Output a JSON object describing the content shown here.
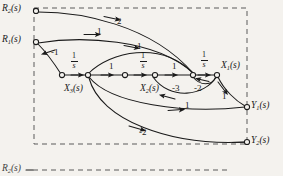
{
  "figure": {
    "kind": "signal-flow-graph",
    "background_color": "#f4f2ee",
    "ink_color": "#1a1a1a",
    "boundary": {
      "style": "dashed",
      "x": 34,
      "y": 8,
      "width": 213,
      "height": 136
    }
  },
  "nodes": [
    {
      "id": "R2",
      "label": "R",
      "sub": "2",
      "suffix": "(s)",
      "x": 36,
      "y": 11,
      "label_x": 2,
      "label_y": 4,
      "kind": "input",
      "open": true
    },
    {
      "id": "R1",
      "label": "R",
      "sub": "1",
      "suffix": "(s)",
      "x": 36,
      "y": 42,
      "label_x": 2,
      "label_y": 35,
      "kind": "input",
      "open": true
    },
    {
      "id": "n1",
      "label": "",
      "sub": "",
      "suffix": "",
      "x": 62,
      "y": 75,
      "label_x": 0,
      "label_y": 0,
      "kind": "sum",
      "open": true
    },
    {
      "id": "X3",
      "label": "X",
      "sub": "3",
      "suffix": "(s)",
      "x": 88,
      "y": 75,
      "label_x": 64,
      "label_y": 84,
      "kind": "state",
      "open": true
    },
    {
      "id": "n2",
      "label": "",
      "sub": "",
      "suffix": "",
      "x": 125,
      "y": 75,
      "label_x": 0,
      "label_y": 0,
      "kind": "sum",
      "open": true
    },
    {
      "id": "X2",
      "label": "X",
      "sub": "2",
      "suffix": "(s)",
      "x": 155,
      "y": 75,
      "label_x": 140,
      "label_y": 84,
      "kind": "state",
      "open": true
    },
    {
      "id": "n3",
      "label": "",
      "sub": "",
      "suffix": "",
      "x": 193,
      "y": 75,
      "label_x": 0,
      "label_y": 0,
      "kind": "sum",
      "open": true
    },
    {
      "id": "X1",
      "label": "X",
      "sub": "1",
      "suffix": "(s)",
      "x": 217,
      "y": 75,
      "label_x": 221,
      "label_y": 61,
      "kind": "state",
      "open": true
    },
    {
      "id": "Y1",
      "label": "Y",
      "sub": "1",
      "suffix": "(s)",
      "x": 247,
      "y": 107,
      "label_x": 251,
      "label_y": 101,
      "kind": "output",
      "open": true
    },
    {
      "id": "Y2",
      "label": "Y",
      "sub": "2",
      "suffix": "(s)",
      "x": 247,
      "y": 142,
      "label_x": 251,
      "label_y": 136,
      "kind": "output",
      "open": true
    }
  ],
  "branches": [
    {
      "id": "b-r2-n3",
      "from": "R2",
      "to": "n3",
      "gain": "2",
      "gain_x": 117,
      "gain_y": 17,
      "gain_type": "scalar"
    },
    {
      "id": "b-r1-n3",
      "from": "R1",
      "to": "n3",
      "gain": "1",
      "gain_x": 97,
      "gain_y": 27,
      "gain_type": "scalar"
    },
    {
      "id": "b-r1-n1",
      "from": "R1",
      "to": "n1",
      "gain": "-1",
      "gain_x": 51,
      "gain_y": 53,
      "gain_type": "scalar"
    },
    {
      "id": "b-n1-x3",
      "from": "n1",
      "to": "X3",
      "gain": "1/s",
      "gain_x": 72,
      "gain_y": 58,
      "gain_type": "fraction",
      "num": "1",
      "den": "s"
    },
    {
      "id": "b-x3-n2",
      "from": "X3",
      "to": "n2",
      "gain": "1",
      "gain_x": 109,
      "gain_y": 65,
      "gain_type": "scalar"
    },
    {
      "id": "b-n2-x2",
      "from": "n2",
      "to": "X2",
      "gain": "1/s",
      "gain_x": 141,
      "gain_y": 58,
      "gain_type": "fraction",
      "num": "1",
      "den": "s"
    },
    {
      "id": "b-x2-n3",
      "from": "X2",
      "to": "n3",
      "gain": "1",
      "gain_x": 172,
      "gain_y": 65,
      "gain_type": "scalar"
    },
    {
      "id": "b-n3-x1",
      "from": "n3",
      "to": "X1",
      "gain": "1/s",
      "gain_x": 203,
      "gain_y": 57,
      "gain_type": "fraction",
      "num": "1",
      "den": "s"
    },
    {
      "id": "b-x3-n3",
      "from": "X3",
      "to": "n3",
      "gain": "1",
      "gain_x": 137,
      "gain_y": 46,
      "gain_type": "scalar"
    },
    {
      "id": "b-x1-x2fb",
      "from": "X1",
      "to": "X2",
      "gain": "-3",
      "gain_x": 173,
      "gain_y": 87,
      "gain_type": "scalar"
    },
    {
      "id": "b-x1-n3fb",
      "from": "X1",
      "to": "n3",
      "gain": "-2",
      "gain_x": 196,
      "gain_y": 87,
      "gain_type": "scalar"
    },
    {
      "id": "b-x1-y1",
      "from": "X1",
      "to": "Y1",
      "gain": "1",
      "gain_x": 223,
      "gain_y": 93,
      "gain_type": "scalar"
    },
    {
      "id": "b-x3-y1",
      "from": "X3",
      "to": "Y1",
      "gain": "1",
      "gain_x": 186,
      "gain_y": 104,
      "gain_type": "scalar"
    },
    {
      "id": "b-x3-y2",
      "from": "X3",
      "to": "Y2",
      "gain": "-2",
      "gain_x": 142,
      "gain_y": 130,
      "gain_type": "scalar"
    }
  ],
  "next_figure": {
    "partial_label": "R",
    "partial_sub": "2",
    "partial_suffix": "(s)",
    "x": 2,
    "y": 167
  }
}
